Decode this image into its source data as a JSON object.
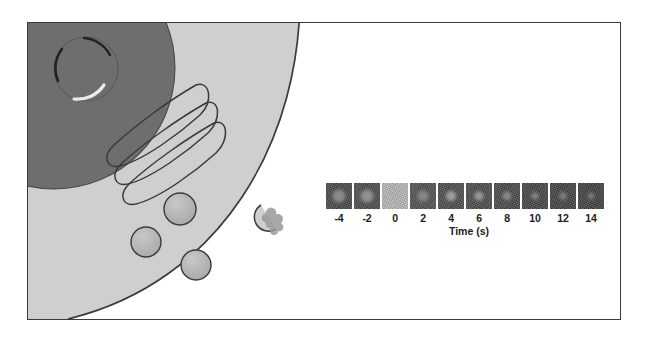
{
  "figure": {
    "background_color": "#ffffff",
    "border_color": "#3a3a3a"
  },
  "cell_diagram": {
    "name": "eukaryotic-cell-quarter-view",
    "cytoplasm_color": "#cfcfcf",
    "nucleus_color": "#6e6e6e",
    "membrane_color": "#3a3a3a",
    "organelles": [
      {
        "name": "nucleus",
        "label": ""
      },
      {
        "name": "nucleolus",
        "label": ""
      },
      {
        "name": "golgi-apparatus",
        "label": ""
      },
      {
        "name": "secretory-vesicle-1",
        "label": ""
      },
      {
        "name": "secretory-vesicle-2",
        "label": ""
      },
      {
        "name": "secretory-vesicle-3",
        "label": ""
      },
      {
        "name": "fusing-vesicle",
        "label": ""
      }
    ],
    "nucleus_annotations": [
      "",
      "",
      ""
    ]
  },
  "frap": {
    "axis_title": "Time (s)",
    "timepoints": [
      "-4",
      "-2",
      "0",
      "2",
      "4",
      "6",
      "8",
      "10",
      "12",
      "14"
    ],
    "frames": [
      {
        "time": "-4",
        "background": "#4a4a4a",
        "spot_color": "#8f8f8f",
        "spot_size": 15,
        "bleached": false
      },
      {
        "time": "-2",
        "background": "#4e4e4e",
        "spot_color": "#949494",
        "spot_size": 15,
        "bleached": false
      },
      {
        "time": "0",
        "background": "#b8b8b8",
        "spot_color": "#bdbdbd",
        "spot_size": 4,
        "bleached": true
      },
      {
        "time": "2",
        "background": "#535353",
        "spot_color": "#8a8a8a",
        "spot_size": 13,
        "bleached": false
      },
      {
        "time": "4",
        "background": "#4f4f4f",
        "spot_color": "#a2a2a2",
        "spot_size": 12,
        "bleached": false
      },
      {
        "time": "6",
        "background": "#4d4d4d",
        "spot_color": "#9c9c9c",
        "spot_size": 11,
        "bleached": false
      },
      {
        "time": "8",
        "background": "#4b4b4b",
        "spot_color": "#8d8d8d",
        "spot_size": 10,
        "bleached": false
      },
      {
        "time": "10",
        "background": "#474747",
        "spot_color": "#858585",
        "spot_size": 9,
        "bleached": false
      },
      {
        "time": "12",
        "background": "#454545",
        "spot_color": "#828282",
        "spot_size": 9,
        "bleached": false
      },
      {
        "time": "14",
        "background": "#434343",
        "spot_color": "#7f7f7f",
        "spot_size": 8,
        "bleached": false
      }
    ]
  }
}
